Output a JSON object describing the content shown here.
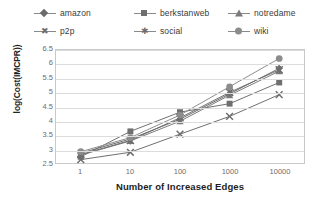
{
  "chart_data": {
    "type": "line",
    "title": "",
    "xlabel": "Number of Increased Edges",
    "ylabel": "log(Cost(IMCPR))",
    "x_scale": "log",
    "categories": [
      "1",
      "10",
      "100",
      "1000",
      "10000"
    ],
    "x_tick_labels": [
      "1",
      "10",
      "100",
      "1000",
      "10000"
    ],
    "y_tick_labels": [
      "2.5",
      "3",
      "3.5",
      "4",
      "4.5",
      "5",
      "5.5",
      "6",
      "6.5"
    ],
    "y_ticks": [
      2.5,
      3,
      3.5,
      4,
      4.5,
      5,
      5.5,
      6,
      6.5
    ],
    "ylim": [
      2.5,
      6.5
    ],
    "grid": "horizontal",
    "legend_position": "top",
    "series": [
      {
        "name": "amazon",
        "marker": "diamond",
        "color": "#6b6b6b",
        "values": [
          2.85,
          3.35,
          4.05,
          4.95,
          5.85
        ]
      },
      {
        "name": "berkstanweb",
        "marker": "square",
        "color": "#6f6f6f",
        "values": [
          2.72,
          3.62,
          4.3,
          4.6,
          5.35
        ]
      },
      {
        "name": "notredame",
        "marker": "triangle",
        "color": "#7b7b7b",
        "values": [
          2.78,
          3.28,
          3.98,
          4.9,
          5.75
        ]
      },
      {
        "name": "p2p",
        "marker": "cross",
        "color": "#6e6e6e",
        "values": [
          2.62,
          2.88,
          3.52,
          4.15,
          4.92
        ]
      },
      {
        "name": "social",
        "marker": "star",
        "color": "#6e6e6e",
        "values": [
          2.8,
          3.3,
          4.1,
          5.0,
          5.8
        ]
      },
      {
        "name": "wiki",
        "marker": "circle",
        "color": "#8c8c8c",
        "values": [
          2.9,
          3.4,
          4.2,
          5.2,
          6.2
        ]
      }
    ]
  },
  "legend": {
    "items": [
      {
        "label": "amazon"
      },
      {
        "label": "berkstanweb"
      },
      {
        "label": "notredame"
      },
      {
        "label": "p2p"
      },
      {
        "label": "social"
      },
      {
        "label": "wiki"
      }
    ]
  },
  "axes": {
    "x_title": "Number of Increased Edges",
    "y_title": "log(Cost(IMCPR))"
  }
}
